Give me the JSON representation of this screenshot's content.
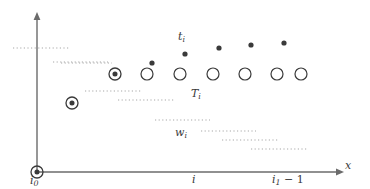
{
  "figure": {
    "width": 370,
    "height": 189,
    "background": "#ffffff",
    "axis_color": "#6b6b6b",
    "marker_color": "#3a3a3a",
    "dotted_color": "#a8a8a8",
    "label_color": "#3a3a3a"
  },
  "axes": {
    "origin": {
      "x": 37,
      "y": 172
    },
    "x_axis": {
      "x_start": 37,
      "x_end": 338,
      "y": 172,
      "arrow": "right"
    },
    "y_axis": {
      "y_start": 172,
      "y_end": 18,
      "x": 37,
      "arrow": "up"
    },
    "x_axis_label": "x",
    "origin_label": "i",
    "origin_label_sub": "0",
    "origin_marker": "bullseye"
  },
  "x_ticks": [
    {
      "name": "i-tick",
      "label": "i",
      "sub": "",
      "x": 195
    },
    {
      "name": "i1-minus-1-tick",
      "label": "i",
      "sub": "1",
      "suffix": " − 1",
      "x": 288
    }
  ],
  "labels": {
    "t_i": {
      "base": "t",
      "sub": "i",
      "x": 178,
      "y": 31
    },
    "T_i": {
      "base": "T",
      "sub": "i",
      "x": 191,
      "y": 88
    },
    "w_i": {
      "base": "w",
      "sub": "i",
      "x": 175,
      "y": 127
    }
  },
  "chart_data": {
    "type": "scatter",
    "title": "",
    "xlabel": "x",
    "ylabel": "",
    "grid": false,
    "legend": "none",
    "annotations": [
      {
        "text": "t_i",
        "x": 185,
        "y": 38
      },
      {
        "text": "T_i",
        "x": 197,
        "y": 95
      },
      {
        "text": "w_i",
        "x": 182,
        "y": 133
      },
      {
        "text": "i_0",
        "x": 37,
        "y": 181
      },
      {
        "text": "i",
        "x": 195,
        "y": 180
      },
      {
        "text": "i_1 - 1",
        "x": 288,
        "y": 180
      },
      {
        "text": "x",
        "x": 350,
        "y": 166
      }
    ],
    "series": [
      {
        "name": "open-circles",
        "marker": "open-circle",
        "radius": 6,
        "points": [
          {
            "x": 147,
            "y": 74
          },
          {
            "x": 180,
            "y": 74
          },
          {
            "x": 213,
            "y": 74
          },
          {
            "x": 245,
            "y": 74
          },
          {
            "x": 277,
            "y": 74
          },
          {
            "x": 301,
            "y": 74
          }
        ]
      },
      {
        "name": "bullseye-markers",
        "marker": "bullseye",
        "radius": 6,
        "points": [
          {
            "x": 115,
            "y": 74
          },
          {
            "x": 72,
            "y": 103
          },
          {
            "x": 37,
            "y": 172
          }
        ]
      },
      {
        "name": "filled-dots",
        "marker": "filled-dot",
        "radius": 2.6,
        "points": [
          {
            "x": 152,
            "y": 63
          },
          {
            "x": 185,
            "y": 54
          },
          {
            "x": 219,
            "y": 48
          },
          {
            "x": 251,
            "y": 45
          },
          {
            "x": 284,
            "y": 43
          }
        ]
      }
    ],
    "dotted_segments": [
      {
        "name": "axis-crossing-line",
        "x1": 13,
        "x2": 69,
        "y": 48
      },
      {
        "name": "segment-2",
        "x1": 53,
        "x2": 108,
        "y": 62
      },
      {
        "name": "segment-3",
        "x1": 61,
        "x2": 112,
        "y": 63
      },
      {
        "name": "segment-4",
        "x1": 85,
        "x2": 141,
        "y": 91
      },
      {
        "name": "segment-5",
        "x1": 118,
        "x2": 174,
        "y": 100
      },
      {
        "name": "segment-6",
        "x1": 155,
        "x2": 210,
        "y": 120
      },
      {
        "name": "segment-7",
        "x1": 201,
        "x2": 256,
        "y": 131
      },
      {
        "name": "segment-8",
        "x1": 222,
        "x2": 278,
        "y": 140
      },
      {
        "name": "segment-9",
        "x1": 251,
        "x2": 307,
        "y": 149
      }
    ]
  }
}
